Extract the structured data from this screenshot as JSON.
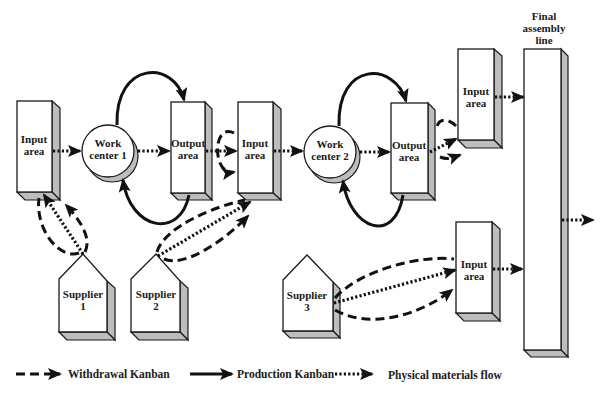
{
  "nodes": {
    "input_area_1": {
      "line1": "Input",
      "line2": "area"
    },
    "work_center_1": {
      "line1": "Work",
      "line2": "center 1"
    },
    "output_area_1": {
      "line1": "Output",
      "line2": "area"
    },
    "input_area_2": {
      "line1": "Input",
      "line2": "area"
    },
    "work_center_2": {
      "line1": "Work",
      "line2": "center 2"
    },
    "output_area_2": {
      "line1": "Output",
      "line2": "area"
    },
    "input_area_3": {
      "line1": "Input",
      "line2": "area"
    },
    "input_area_4": {
      "line1": "Input",
      "line2": "area"
    },
    "final_assembly": {
      "line1": "Final",
      "line2": "assembly",
      "line3": "line"
    },
    "supplier_1": {
      "line1": "Supplier",
      "line2": "1"
    },
    "supplier_2": {
      "line1": "Supplier",
      "line2": "2"
    },
    "supplier_3": {
      "line1": "Supplier",
      "line2": "3"
    }
  },
  "legend": {
    "withdrawal": "Withdrawal Kanban",
    "production": "Production Kanban",
    "physical": "Physical materials flow"
  },
  "colors": {
    "line": "#111111",
    "shade": "#bdbdbd",
    "face": "#ffffff"
  }
}
